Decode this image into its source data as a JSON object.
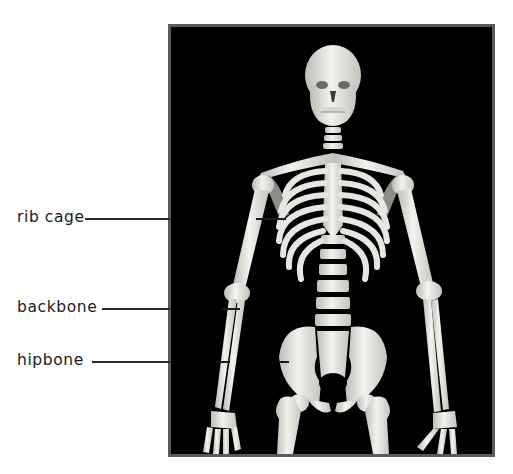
{
  "figure": {
    "background_color": "#000000",
    "frame_border_color": "#5a5a5a",
    "bone_color": "#e8e8e4"
  },
  "labels": [
    {
      "id": "rib-cage",
      "text": "rib cage",
      "y": 219
    },
    {
      "id": "backbone",
      "text": "backbone",
      "y": 309
    },
    {
      "id": "hipbone",
      "text": "hipbone",
      "y": 362
    }
  ]
}
